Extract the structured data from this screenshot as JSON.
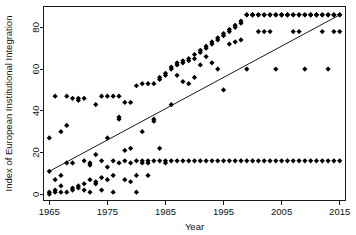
{
  "chart_data": {
    "type": "scatter",
    "title": "",
    "xlabel": "Year",
    "ylabel": "Index of European Institutional Integration",
    "xlim": [
      1964,
      2016
    ],
    "ylim": [
      -3,
      90
    ],
    "xticks": [
      1965,
      1975,
      1985,
      1995,
      2005,
      2015
    ],
    "yticks": [
      0,
      20,
      40,
      60,
      80
    ],
    "grid": false,
    "legend": null,
    "marker": "diamond",
    "marker_color": "#000000",
    "trend_line": {
      "visible": true,
      "x": [
        1965,
        2015
      ],
      "y": [
        11,
        86
      ],
      "color": "#1a1a1a"
    },
    "points": [
      [
        1965,
        27
      ],
      [
        1965,
        11
      ],
      [
        1965,
        1
      ],
      [
        1965,
        0
      ],
      [
        1966,
        1
      ],
      [
        1966,
        2
      ],
      [
        1966,
        7
      ],
      [
        1966,
        47
      ],
      [
        1967,
        30
      ],
      [
        1967,
        9
      ],
      [
        1967,
        4
      ],
      [
        1967,
        1
      ],
      [
        1968,
        33
      ],
      [
        1968,
        15
      ],
      [
        1968,
        1
      ],
      [
        1968,
        47
      ],
      [
        1969,
        15
      ],
      [
        1969,
        3
      ],
      [
        1969,
        2
      ],
      [
        1969,
        46
      ],
      [
        1970,
        4
      ],
      [
        1970,
        3
      ],
      [
        1970,
        45
      ],
      [
        1970,
        46
      ],
      [
        1971,
        16
      ],
      [
        1971,
        5
      ],
      [
        1971,
        2
      ],
      [
        1971,
        46
      ],
      [
        1972,
        15
      ],
      [
        1972,
        14
      ],
      [
        1972,
        7
      ],
      [
        1972,
        1
      ],
      [
        1973,
        19
      ],
      [
        1973,
        6
      ],
      [
        1973,
        5
      ],
      [
        1973,
        43
      ],
      [
        1974,
        16
      ],
      [
        1974,
        2
      ],
      [
        1974,
        8
      ],
      [
        1974,
        47
      ],
      [
        1975,
        27
      ],
      [
        1975,
        13
      ],
      [
        1975,
        7
      ],
      [
        1975,
        47
      ],
      [
        1976,
        16
      ],
      [
        1976,
        9
      ],
      [
        1976,
        1
      ],
      [
        1976,
        47
      ],
      [
        1977,
        36
      ],
      [
        1977,
        37
      ],
      [
        1977,
        15
      ],
      [
        1977,
        47
      ],
      [
        1978,
        21
      ],
      [
        1978,
        16
      ],
      [
        1978,
        7
      ],
      [
        1978,
        44
      ],
      [
        1979,
        22
      ],
      [
        1979,
        15
      ],
      [
        1979,
        6
      ],
      [
        1979,
        44
      ],
      [
        1980,
        16
      ],
      [
        1980,
        9
      ],
      [
        1980,
        1
      ],
      [
        1980,
        52
      ],
      [
        1981,
        30
      ],
      [
        1981,
        16
      ],
      [
        1981,
        15
      ],
      [
        1981,
        53
      ],
      [
        1982,
        16
      ],
      [
        1982,
        15
      ],
      [
        1982,
        9
      ],
      [
        1982,
        53
      ],
      [
        1983,
        35
      ],
      [
        1983,
        36
      ],
      [
        1983,
        16
      ],
      [
        1983,
        53
      ],
      [
        1984,
        22
      ],
      [
        1984,
        16
      ],
      [
        1984,
        55
      ],
      [
        1984,
        56
      ],
      [
        1985,
        16
      ],
      [
        1985,
        15
      ],
      [
        1985,
        57
      ],
      [
        1985,
        58
      ],
      [
        1986,
        16
      ],
      [
        1986,
        43
      ],
      [
        1986,
        60
      ],
      [
        1986,
        61
      ],
      [
        1987,
        16
      ],
      [
        1987,
        57
      ],
      [
        1987,
        62
      ],
      [
        1987,
        63
      ],
      [
        1988,
        16
      ],
      [
        1988,
        54
      ],
      [
        1988,
        63
      ],
      [
        1988,
        64
      ],
      [
        1989,
        16
      ],
      [
        1989,
        53
      ],
      [
        1989,
        64
      ],
      [
        1989,
        65
      ],
      [
        1990,
        16
      ],
      [
        1990,
        56
      ],
      [
        1990,
        65
      ],
      [
        1990,
        67
      ],
      [
        1991,
        16
      ],
      [
        1991,
        62
      ],
      [
        1991,
        68
      ],
      [
        1991,
        69
      ],
      [
        1992,
        16
      ],
      [
        1992,
        66
      ],
      [
        1992,
        70
      ],
      [
        1992,
        71
      ],
      [
        1993,
        16
      ],
      [
        1993,
        63
      ],
      [
        1993,
        72
      ],
      [
        1993,
        73
      ],
      [
        1994,
        16
      ],
      [
        1994,
        60
      ],
      [
        1994,
        74
      ],
      [
        1994,
        75
      ],
      [
        1995,
        16
      ],
      [
        1995,
        50
      ],
      [
        1995,
        76
      ],
      [
        1995,
        77
      ],
      [
        1996,
        16
      ],
      [
        1996,
        72
      ],
      [
        1996,
        78
      ],
      [
        1996,
        79
      ],
      [
        1997,
        16
      ],
      [
        1997,
        73
      ],
      [
        1997,
        80
      ],
      [
        1997,
        81
      ],
      [
        1998,
        16
      ],
      [
        1998,
        74
      ],
      [
        1998,
        82
      ],
      [
        1998,
        83
      ],
      [
        1999,
        16
      ],
      [
        1999,
        60
      ],
      [
        1999,
        86
      ],
      [
        1999,
        86
      ],
      [
        2000,
        16
      ],
      [
        2000,
        86
      ],
      [
        2000,
        86
      ],
      [
        2000,
        86
      ],
      [
        2001,
        16
      ],
      [
        2001,
        78
      ],
      [
        2001,
        86
      ],
      [
        2001,
        86
      ],
      [
        2002,
        16
      ],
      [
        2002,
        78
      ],
      [
        2002,
        86
      ],
      [
        2002,
        86
      ],
      [
        2003,
        16
      ],
      [
        2003,
        78
      ],
      [
        2003,
        86
      ],
      [
        2003,
        86
      ],
      [
        2004,
        16
      ],
      [
        2004,
        60
      ],
      [
        2004,
        86
      ],
      [
        2004,
        86
      ],
      [
        2005,
        16
      ],
      [
        2005,
        86
      ],
      [
        2005,
        86
      ],
      [
        2005,
        86
      ],
      [
        2006,
        16
      ],
      [
        2006,
        86
      ],
      [
        2006,
        86
      ],
      [
        2006,
        86
      ],
      [
        2007,
        16
      ],
      [
        2007,
        78
      ],
      [
        2007,
        86
      ],
      [
        2007,
        86
      ],
      [
        2008,
        16
      ],
      [
        2008,
        78
      ],
      [
        2008,
        86
      ],
      [
        2008,
        86
      ],
      [
        2009,
        16
      ],
      [
        2009,
        60
      ],
      [
        2009,
        86
      ],
      [
        2009,
        86
      ],
      [
        2010,
        16
      ],
      [
        2010,
        86
      ],
      [
        2010,
        86
      ],
      [
        2010,
        86
      ],
      [
        2011,
        16
      ],
      [
        2011,
        86
      ],
      [
        2011,
        86
      ],
      [
        2011,
        86
      ],
      [
        2012,
        16
      ],
      [
        2012,
        78
      ],
      [
        2012,
        86
      ],
      [
        2012,
        86
      ],
      [
        2013,
        16
      ],
      [
        2013,
        60
      ],
      [
        2013,
        86
      ],
      [
        2013,
        86
      ],
      [
        2014,
        16
      ],
      [
        2014,
        78
      ],
      [
        2014,
        86
      ],
      [
        2014,
        86
      ],
      [
        2015,
        16
      ],
      [
        2015,
        78
      ],
      [
        2015,
        86
      ],
      [
        2015,
        86
      ]
    ]
  }
}
